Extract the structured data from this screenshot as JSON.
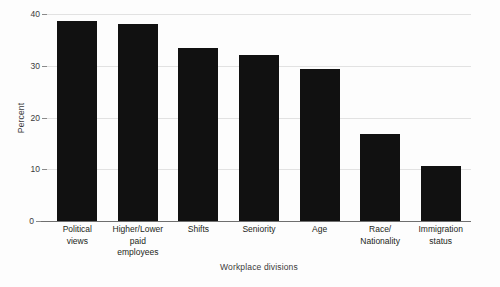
{
  "chart_data": {
    "type": "bar",
    "title": "",
    "xlabel": "Workplace divisions",
    "ylabel": "Percent",
    "categories": [
      "Political views",
      "Higher/Lower paid employees",
      "Shifts",
      "Seniority",
      "Age",
      "Race/ Nationality",
      "Immigration status"
    ],
    "category_lines": [
      [
        "Political",
        "views"
      ],
      [
        "Higher/Lower",
        "paid",
        "employees"
      ],
      [
        "Shifts"
      ],
      [
        "Seniority"
      ],
      [
        "Age"
      ],
      [
        "Race/",
        "Nationality"
      ],
      [
        "Immigration",
        "status"
      ]
    ],
    "values": [
      38.7,
      38.0,
      33.4,
      32.0,
      29.4,
      16.8,
      10.7
    ],
    "ylim": [
      0,
      40
    ],
    "yticks": [
      0,
      10,
      20,
      30,
      40
    ],
    "ytick_labels": [
      "0",
      "10",
      "20",
      "30",
      "40"
    ],
    "grid": true,
    "legend": false,
    "bar_color": "#111111",
    "grid_color": "#e2e2e2",
    "axis_color": "#6f6f6f",
    "background_color": "#fdfdfd"
  },
  "axes": {
    "y_title": "Percent",
    "x_title": "Workplace divisions"
  }
}
